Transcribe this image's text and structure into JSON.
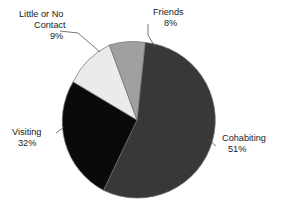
{
  "chart_data": {
    "type": "pie",
    "title": "",
    "subtitle": "",
    "xlabel": "",
    "ylabel": "",
    "legend_position": "none",
    "grid": false,
    "labels_outside": true,
    "units": "percent",
    "categories": [
      "Cohabiting",
      "Visiting",
      "Little or No Contact",
      "Friends"
    ],
    "values": [
      51,
      32,
      9,
      8
    ],
    "slices": [
      {
        "label": "Cohabiting",
        "value": 51,
        "value_text": "51%",
        "color": "#383838",
        "label_x": 222,
        "label_y": 141,
        "pct_x": 228,
        "pct_y": 152
      },
      {
        "label": "Visiting",
        "value": 32,
        "value_text": "32%",
        "color": "#0a0a0a",
        "label_x": 12,
        "label_y": 135,
        "pct_x": 18,
        "pct_y": 146
      },
      {
        "label": "Little or No",
        "label_line2": "Contact",
        "value": 9,
        "value_text": "9%",
        "color": "#ebebeb",
        "label_x": 19,
        "label_y": 17,
        "label2_x": 34,
        "label2_y": 28,
        "pct_x": 50,
        "pct_y": 39
      },
      {
        "label": "Friends",
        "value": 8,
        "value_text": "8%",
        "color": "#a0a0a0",
        "label_x": 153,
        "label_y": 15,
        "pct_x": 164,
        "pct_y": 26
      }
    ]
  },
  "geometry": {
    "center_x": 137,
    "center_y": 120,
    "radius": 78,
    "start_angle_deg": -84
  },
  "paths": {
    "cohabiting": "M 137 120 L 145.15 42.43 A 78 78 0 1 1 103.43 190.3 Z",
    "visiting": "M 137 120 L 103.43 190.3 A 78 78 0 0 1 73.14 81.8 Z",
    "contact": "M 137 120 L 73.14 81.8 A 78 78 0 0 1 109.4 45.1 Z",
    "friends": "M 137 120 L 109.4 45.1 A 78 78 0 0 1 145.15 42.43 Z"
  },
  "leaders": {
    "cohabiting": "M 216 146 L 208 139",
    "visiting": "M 56 133 L 64 127",
    "contact": "M 60 31 L 78 33 L 100 52",
    "friends": "M 148 24 L 148 35 L 155 47"
  },
  "colors": {
    "background": "#ffffff",
    "text": "#1a1a1a",
    "slice_outline": "#6f6f6f",
    "leader_line": "#555555"
  }
}
